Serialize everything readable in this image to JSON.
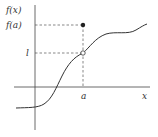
{
  "diagram": {
    "labels": {
      "y_axis": "f(x)",
      "fa": "f(a)",
      "limit": "l",
      "a": "a",
      "x_axis": "x"
    },
    "points": {
      "filled": {
        "label": "f(a)",
        "x": 83,
        "y": 25
      },
      "open": {
        "label": "l",
        "x": 83,
        "y": 53
      }
    },
    "colors": {
      "line": "#333333",
      "dash": "#555555",
      "background": "#ffffff"
    }
  }
}
